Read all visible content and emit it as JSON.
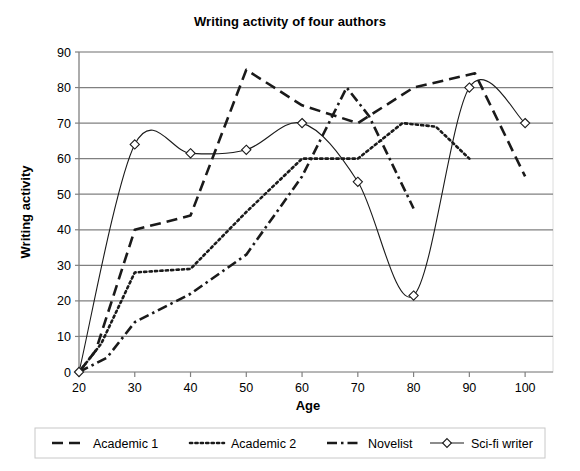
{
  "chart_data": {
    "type": "line",
    "title": "Writing activity of four authors",
    "xlabel": "Age",
    "ylabel": "Writing activity",
    "xlim": [
      20,
      105
    ],
    "ylim": [
      0,
      90
    ],
    "xticks": [
      20,
      30,
      40,
      50,
      60,
      70,
      80,
      90,
      100
    ],
    "yticks": [
      0,
      10,
      20,
      30,
      40,
      50,
      60,
      70,
      80,
      90
    ],
    "grid": "horizontal",
    "legend_position": "bottom",
    "series": [
      {
        "name": "Academic 1",
        "style": "long-dash",
        "color": "#1a1a1a",
        "marker": "none",
        "x": [
          20,
          23,
          30,
          40,
          50,
          60,
          70,
          80,
          91,
          100
        ],
        "values": [
          0,
          6,
          40,
          44,
          85,
          75,
          70,
          80,
          84,
          55
        ]
      },
      {
        "name": "Academic 2",
        "style": "dotted",
        "color": "#1a1a1a",
        "marker": "none",
        "x": [
          20,
          24,
          30,
          40,
          50,
          60,
          70,
          78,
          84,
          90
        ],
        "values": [
          0,
          8,
          28,
          29,
          45,
          60,
          60,
          70,
          69,
          60
        ]
      },
      {
        "name": "Novelist",
        "style": "dash-dot",
        "color": "#1a1a1a",
        "marker": "none",
        "x": [
          20,
          25,
          30,
          40,
          50,
          60,
          68,
          72,
          80
        ],
        "values": [
          0,
          4,
          14,
          22,
          33,
          55,
          80,
          72,
          46
        ]
      },
      {
        "name": "Sci-fi writer",
        "style": "solid",
        "color": "#1a1a1a",
        "marker": "diamond",
        "x": [
          20,
          30,
          40,
          50,
          60,
          70,
          80,
          90,
          100
        ],
        "values": [
          0,
          64,
          61.5,
          62.5,
          70,
          53.5,
          21.5,
          80,
          70
        ]
      }
    ]
  },
  "axis": {
    "y_tick_labels": [
      "90",
      "80",
      "70",
      "60",
      "50",
      "40",
      "30",
      "20",
      "10",
      "0"
    ],
    "x_tick_labels": [
      "20",
      "30",
      "40",
      "50",
      "60",
      "70",
      "80",
      "90",
      "100"
    ]
  },
  "legend": {
    "items": [
      {
        "label": "Academic 1",
        "style": "long-dash",
        "marker": "none"
      },
      {
        "label": "Academic 2",
        "style": "dotted",
        "marker": "none"
      },
      {
        "label": "Novelist",
        "style": "dash-dot",
        "marker": "none"
      },
      {
        "label": "Sci-fi writer",
        "style": "solid",
        "marker": "diamond"
      }
    ]
  },
  "colors": {
    "line": "#1a1a1a",
    "grid": "#808080",
    "axis": "#808080",
    "legend_border": "#c8c8c8",
    "text": "#000000",
    "background": "#ffffff"
  }
}
